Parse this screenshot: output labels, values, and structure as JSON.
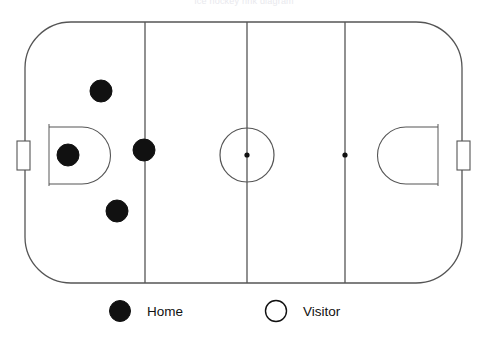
{
  "figure": {
    "title": "Ice hockey rink diagram",
    "type": "hockey-rink-position-diagram"
  },
  "colors": {
    "rink_line": "#555555",
    "marker_fill": "#111111",
    "marker_stroke": "#111111",
    "visitor_fill": "#ffffff",
    "background": "#ffffff",
    "label_text": "#111111"
  },
  "rink": {
    "outline": {
      "x": 25,
      "y": 22,
      "width": 437,
      "height": 261,
      "corner_radius": 46,
      "stroke_width": 1.3
    },
    "lines": [
      {
        "name": "left-blue-line",
        "x": 145,
        "y1": 22,
        "y2": 283
      },
      {
        "name": "center-red-line",
        "x": 247,
        "y1": 22,
        "y2": 283
      },
      {
        "name": "right-blue-line",
        "x": 345,
        "y1": 22,
        "y2": 283
      }
    ],
    "goal_lines": [
      {
        "name": "left-goal-line",
        "x": 49,
        "y1": 124,
        "y2": 186
      },
      {
        "name": "right-goal-line",
        "x": 438,
        "y1": 124,
        "y2": 186
      }
    ],
    "center_circle": {
      "cx": 247,
      "cy": 155,
      "r": 27
    },
    "faceoff_dots": [
      {
        "name": "center-faceoff-dot",
        "cx": 247,
        "cy": 155,
        "r": 2.6
      },
      {
        "name": "right-faceoff-dot",
        "cx": 345,
        "cy": 155,
        "r": 2.6
      }
    ],
    "creases": [
      {
        "name": "left-crease",
        "side": "left",
        "x": 49,
        "y": 127,
        "width": 62,
        "height": 57
      },
      {
        "name": "right-crease",
        "side": "right",
        "x": 377,
        "y": 127,
        "width": 62,
        "height": 57
      }
    ],
    "nets": [
      {
        "name": "left-net",
        "x": 17,
        "y": 141,
        "width": 13,
        "height": 29
      },
      {
        "name": "right-net",
        "x": 457,
        "y": 141,
        "width": 13,
        "height": 29
      }
    ]
  },
  "markers": [
    {
      "name": "home-player-1",
      "team": "home",
      "cx": 101,
      "cy": 91,
      "r": 11
    },
    {
      "name": "home-player-2",
      "team": "home",
      "cx": 68,
      "cy": 155,
      "r": 11
    },
    {
      "name": "home-player-3",
      "team": "home",
      "cx": 144,
      "cy": 150,
      "r": 11
    },
    {
      "name": "home-player-4",
      "team": "home",
      "cx": 117,
      "cy": 211,
      "r": 11
    }
  ],
  "legend": {
    "items": [
      {
        "name": "home",
        "label": "Home",
        "marker": "filled-circle",
        "marker_cx": 120,
        "marker_cy": 311,
        "marker_r": 10.5,
        "label_x": 147,
        "label_y": 316
      },
      {
        "name": "visitor",
        "label": "Visitor",
        "marker": "open-circle",
        "marker_cx": 276,
        "marker_cy": 311,
        "marker_r": 10.5,
        "label_x": 303,
        "label_y": 316
      }
    ]
  }
}
